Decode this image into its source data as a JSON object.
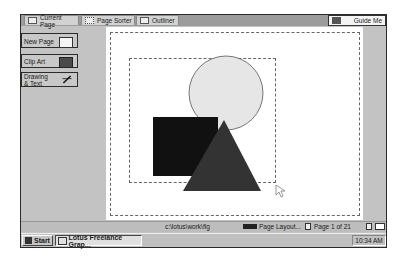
{
  "view_tabs": [
    {
      "label": "Current Page",
      "icon": "page-icon"
    },
    {
      "label": "Page Sorter",
      "icon": "grid-icon"
    },
    {
      "label": "Outliner",
      "icon": "outline-icon"
    }
  ],
  "guide_me": {
    "label": "Guide Me",
    "icon": "guide-icon"
  },
  "left_panel": {
    "buttons": [
      {
        "label": "New Page",
        "icon": "new-page-icon"
      },
      {
        "label": "Clip Art",
        "icon": "clip-art-icon"
      },
      {
        "label_line1": "Drawing",
        "label_line2": "& Text",
        "icon": "drawing-text-icon"
      }
    ]
  },
  "canvas": {
    "shapes": [
      {
        "type": "circle",
        "fill": "#e6e6e6",
        "stroke": "#555555"
      },
      {
        "type": "square",
        "fill": "#111111"
      },
      {
        "type": "triangle",
        "fill": "#333333"
      }
    ]
  },
  "status_bar": {
    "path": "c:\\lotus\\work\\flg",
    "layout": "Page Layout...",
    "page": "Page 1 of 21"
  },
  "taskbar": {
    "start_label": "Start",
    "app_label": "Lotus Freelance Grap...",
    "clock": "10:34 AM"
  }
}
